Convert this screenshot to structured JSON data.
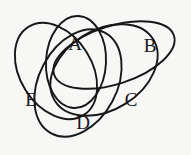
{
  "figure": {
    "name": "five-set-venn-diagram",
    "background_color": "#f7f7f5",
    "stroke_color": "#17171a",
    "stroke_width": 1.9,
    "width": 191,
    "height": 155
  },
  "sets": [
    {
      "id": "A",
      "label": "A",
      "label_x": 75,
      "label_y": 46,
      "ellipse": {
        "cx": 76,
        "cy": 62,
        "rx": 30,
        "ry": 46,
        "rotate": 3
      }
    },
    {
      "id": "B",
      "label": "B",
      "label_x": 150,
      "label_y": 48,
      "ellipse": {
        "cx": 114,
        "cy": 55,
        "rx": 63,
        "ry": 29,
        "rotate": -18
      }
    },
    {
      "id": "C",
      "label": "C",
      "label_x": 131,
      "label_y": 102,
      "ellipse": {
        "cx": 104,
        "cy": 70,
        "rx": 40,
        "ry": 58,
        "rotate": 58
      }
    },
    {
      "id": "D",
      "label": "D",
      "label_x": 83,
      "label_y": 125,
      "ellipse": {
        "cx": 78,
        "cy": 83,
        "rx": 57,
        "ry": 39,
        "rotate": 118
      }
    },
    {
      "id": "E",
      "label": "E",
      "label_x": 31,
      "label_y": 102,
      "ellipse": {
        "cx": 56,
        "cy": 71,
        "rx": 36,
        "ry": 52,
        "rotate": 148
      }
    }
  ]
}
